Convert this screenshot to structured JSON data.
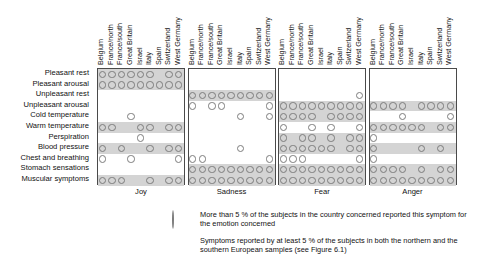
{
  "figure": {
    "countries": [
      "Belgium",
      "France/north",
      "France/south",
      "Great Britain",
      "Israel",
      "Italy",
      "Spain",
      "Switzerland",
      "West Germany"
    ],
    "symptoms": [
      "Pleasant rest",
      "Pleasant arousal",
      "Unpleasant rest",
      "Unpleasant arousal",
      "Cold temperature",
      "Warm temperature",
      "Perspiration",
      "Blood pressure",
      "Chest and breathing",
      "Stomach sensations",
      "Muscular symptoms"
    ],
    "panels": [
      "Joy",
      "Sadness",
      "Fear",
      "Anger"
    ]
  },
  "legend": {
    "circle_icon": "open-circle",
    "circle_text": "More than 5 % of the subjects in the country concerned reported this symptom for the emotion concerned",
    "swatch_icon": "grey-band-swatch",
    "swatch_text": "Symptoms reported by at least 5 % of the subjects in both the northern and the southern European samples (see Figure 6.1)"
  },
  "colors": {
    "band": "#d4d4d4",
    "circle_stroke": "#7c7c7c",
    "frame": "#4a4a4a",
    "text": "#111111",
    "background": "#ffffff"
  },
  "chart_data": {
    "type": "heatmap",
    "title": "",
    "xlabel": "",
    "ylabel": "",
    "legend_position": "bottom",
    "grid": false,
    "x_categories": [
      "Belgium",
      "France/north",
      "France/south",
      "Great Britain",
      "Israel",
      "Italy",
      "Spain",
      "Switzerland",
      "West Germany"
    ],
    "y_categories": [
      "Pleasant rest",
      "Pleasant arousal",
      "Unpleasant rest",
      "Unpleasant arousal",
      "Cold temperature",
      "Warm temperature",
      "Perspiration",
      "Blood pressure",
      "Chest and breathing",
      "Stomach sensations",
      "Muscular symptoms"
    ],
    "panels": [
      {
        "name": "Joy",
        "banded_rows": [
          "Pleasant rest",
          "Pleasant arousal",
          "Warm temperature",
          "Blood pressure",
          "Muscular symptoms"
        ],
        "cells": {
          "Pleasant rest": [
            1,
            1,
            1,
            1,
            1,
            1,
            0,
            1,
            1
          ],
          "Pleasant arousal": [
            1,
            1,
            1,
            1,
            1,
            1,
            1,
            1,
            1
          ],
          "Unpleasant rest": [
            0,
            0,
            0,
            0,
            0,
            0,
            0,
            0,
            0
          ],
          "Unpleasant arousal": [
            0,
            0,
            0,
            0,
            0,
            0,
            0,
            0,
            0
          ],
          "Cold temperature": [
            0,
            0,
            0,
            1,
            0,
            0,
            0,
            0,
            0
          ],
          "Warm temperature": [
            1,
            1,
            0,
            0,
            1,
            1,
            0,
            1,
            1
          ],
          "Perspiration": [
            0,
            0,
            0,
            0,
            1,
            0,
            0,
            0,
            0
          ],
          "Blood pressure": [
            1,
            0,
            1,
            0,
            0,
            1,
            0,
            1,
            1
          ],
          "Chest and breathing": [
            1,
            0,
            0,
            1,
            0,
            0,
            0,
            0,
            1
          ],
          "Muscular symptoms": [
            1,
            1,
            1,
            0,
            0,
            1,
            0,
            1,
            1
          ],
          "Stomach sensations": [
            0,
            0,
            0,
            0,
            0,
            0,
            0,
            0,
            0
          ]
        }
      },
      {
        "name": "Sadness",
        "banded_rows": [
          "Unpleasant rest",
          "Stomach sensations",
          "Muscular symptoms"
        ],
        "cells": {
          "Pleasant rest": [
            0,
            0,
            0,
            0,
            0,
            0,
            0,
            0,
            0
          ],
          "Pleasant arousal": [
            0,
            0,
            0,
            0,
            0,
            0,
            0,
            0,
            0
          ],
          "Unpleasant rest": [
            1,
            1,
            1,
            1,
            1,
            1,
            1,
            1,
            1
          ],
          "Unpleasant arousal": [
            1,
            0,
            1,
            1,
            0,
            0,
            0,
            0,
            1
          ],
          "Cold temperature": [
            0,
            0,
            0,
            0,
            0,
            1,
            0,
            0,
            1
          ],
          "Warm temperature": [
            0,
            0,
            0,
            0,
            0,
            0,
            0,
            0,
            0
          ],
          "Perspiration": [
            0,
            0,
            0,
            0,
            0,
            0,
            0,
            0,
            0
          ],
          "Blood pressure": [
            0,
            0,
            0,
            0,
            0,
            1,
            0,
            0,
            0
          ],
          "Chest and breathing": [
            1,
            1,
            0,
            0,
            0,
            0,
            0,
            0,
            1
          ],
          "Stomach sensations": [
            1,
            1,
            1,
            1,
            1,
            1,
            1,
            1,
            1
          ],
          "Muscular symptoms": [
            1,
            1,
            1,
            1,
            1,
            1,
            1,
            1,
            1
          ]
        }
      },
      {
        "name": "Fear",
        "banded_rows": [
          "Unpleasant arousal",
          "Cold temperature",
          "Blood pressure",
          "Perspiration",
          "Stomach sensations",
          "Muscular symptoms"
        ],
        "cells": {
          "Pleasant rest": [
            0,
            0,
            0,
            0,
            0,
            0,
            0,
            0,
            0
          ],
          "Pleasant arousal": [
            0,
            0,
            0,
            0,
            0,
            0,
            0,
            0,
            0
          ],
          "Unpleasant rest": [
            0,
            0,
            0,
            0,
            0,
            0,
            0,
            0,
            1
          ],
          "Unpleasant arousal": [
            1,
            1,
            1,
            1,
            1,
            1,
            1,
            1,
            1
          ],
          "Cold temperature": [
            1,
            1,
            1,
            1,
            0,
            1,
            1,
            1,
            1
          ],
          "Warm temperature": [
            1,
            0,
            0,
            1,
            0,
            1,
            0,
            0,
            1
          ],
          "Perspiration": [
            1,
            0,
            1,
            1,
            0,
            1,
            0,
            1,
            1
          ],
          "Blood pressure": [
            1,
            1,
            1,
            1,
            1,
            1,
            0,
            1,
            1
          ],
          "Chest and breathing": [
            1,
            1,
            1,
            0,
            0,
            0,
            0,
            0,
            1
          ],
          "Stomach sensations": [
            1,
            1,
            1,
            1,
            1,
            1,
            1,
            1,
            1
          ],
          "Muscular symptoms": [
            1,
            1,
            1,
            1,
            1,
            1,
            1,
            1,
            1
          ]
        }
      },
      {
        "name": "Anger",
        "banded_rows": [
          "Unpleasant arousal",
          "Warm temperature",
          "Blood pressure",
          "Stomach sensations",
          "Muscular symptoms"
        ],
        "cells": {
          "Pleasant rest": [
            0,
            0,
            0,
            0,
            0,
            0,
            0,
            0,
            0
          ],
          "Pleasant arousal": [
            0,
            0,
            0,
            0,
            0,
            0,
            0,
            0,
            0
          ],
          "Unpleasant rest": [
            0,
            0,
            0,
            0,
            0,
            0,
            0,
            0,
            0
          ],
          "Unpleasant arousal": [
            1,
            1,
            1,
            1,
            0,
            1,
            1,
            1,
            1
          ],
          "Cold temperature": [
            0,
            0,
            0,
            1,
            0,
            0,
            0,
            0,
            1
          ],
          "Warm temperature": [
            1,
            1,
            1,
            1,
            1,
            1,
            0,
            1,
            1
          ],
          "Perspiration": [
            1,
            0,
            0,
            0,
            0,
            0,
            0,
            0,
            0
          ],
          "Blood pressure": [
            1,
            0,
            0,
            0,
            0,
            1,
            0,
            1,
            0
          ],
          "Chest and breathing": [
            1,
            0,
            0,
            0,
            0,
            0,
            0,
            0,
            0
          ],
          "Stomach sensations": [
            1,
            1,
            1,
            1,
            0,
            1,
            0,
            1,
            1
          ],
          "Muscular symptoms": [
            1,
            1,
            1,
            1,
            1,
            1,
            1,
            1,
            1
          ]
        }
      }
    ]
  }
}
